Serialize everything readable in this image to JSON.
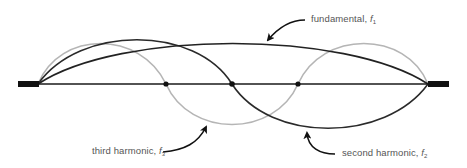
{
  "diagram": {
    "type": "standing-wave-harmonics",
    "string": {
      "left_x": 38,
      "right_x": 428,
      "y": 84
    },
    "colors": {
      "string": "#1a1a1a",
      "fundamental": "#222222",
      "second_harmonic": "#2a2a2a",
      "third_harmonic": "#b5b5b5",
      "clamp": "#111111",
      "label_text": "#555555"
    },
    "nodes": [
      {
        "x": 166,
        "y": 84
      },
      {
        "x": 232,
        "y": 84
      },
      {
        "x": 298,
        "y": 84
      }
    ],
    "labels": {
      "fundamental": {
        "text": "fundamental, ",
        "symbol": "f",
        "subscript": "1"
      },
      "second_harmonic": {
        "text": "second harmonic, ",
        "symbol": "f",
        "subscript": "2"
      },
      "third_harmonic": {
        "text": "third harmonic, ",
        "symbol": "f",
        "subscript": "3"
      }
    }
  }
}
